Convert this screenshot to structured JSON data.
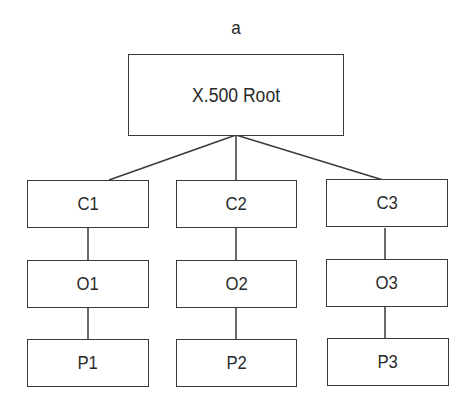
{
  "diagram": {
    "label": "a",
    "root": {
      "label": "X.500 Root"
    },
    "branches": [
      {
        "country": "C1",
        "organization": "O1",
        "person": "P1"
      },
      {
        "country": "C2",
        "organization": "O2",
        "person": "P2"
      },
      {
        "country": "C3",
        "organization": "O3",
        "person": "P3"
      }
    ],
    "colors": {
      "stroke": "#3a3a3a",
      "text": "#2a2a2a",
      "background": "#ffffff"
    }
  }
}
